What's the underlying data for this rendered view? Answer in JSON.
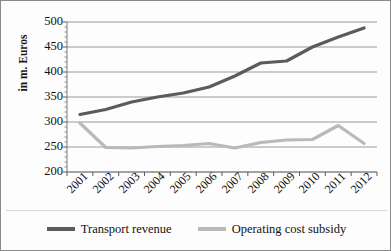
{
  "figure": {
    "border_color": "#8a8a8a",
    "background": "#fdfdfd"
  },
  "chart_data": {
    "type": "line",
    "title": "",
    "xlabel": "",
    "ylabel": "in m. Euros",
    "ylim": [
      200,
      500
    ],
    "ytick_values": [
      500,
      450,
      400,
      350,
      300,
      250,
      200
    ],
    "ytick_labels": [
      "500",
      "450",
      "400",
      "350",
      "300",
      "250",
      "200"
    ],
    "grid": true,
    "grid_color": "#9a9a9a",
    "minor_ticks": true,
    "legend_position": "bottom",
    "categories": [
      "2001",
      "2002",
      "2003",
      "2004",
      "2005",
      "2006",
      "2007",
      "2008",
      "2009",
      "2010",
      "2011",
      "2012"
    ],
    "series": [
      {
        "name": "Transport revenue",
        "color": "#5b5b5b",
        "line_width": 3.2,
        "values": [
          315,
          325,
          340,
          350,
          358,
          370,
          392,
          418,
          422,
          450,
          470,
          488
        ]
      },
      {
        "name": "Operating cost subsidy",
        "color": "#b9b9b9",
        "line_width": 3.2,
        "values": [
          298,
          249,
          248,
          251,
          253,
          257,
          248,
          259,
          264,
          265,
          293,
          257
        ]
      }
    ]
  },
  "legend": {
    "entries": [
      {
        "label": "Transport revenue",
        "color": "#5b5b5b"
      },
      {
        "label": "Operating cost subsidy",
        "color": "#b9b9b9"
      }
    ]
  }
}
